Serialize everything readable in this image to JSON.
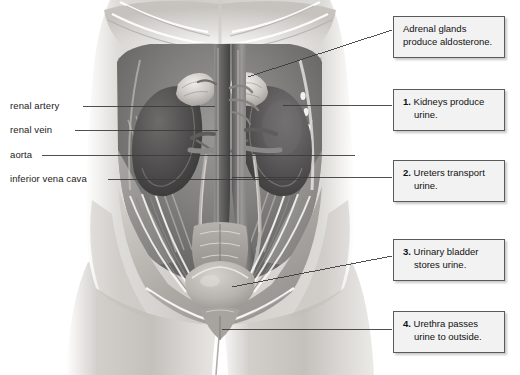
{
  "figure": {
    "palette": {
      "skin_light": "#e9e7e4",
      "skin_mid": "#c9c6c2",
      "skin_shadow": "#9a9894",
      "muscle": "#b6b3af",
      "cavity_dark": "#6b6a68",
      "kidney": "#4e4d4c",
      "kidney_light": "#757372",
      "vessel": "#8a8887",
      "bladder": "#bdbab6",
      "outline": "#4a4a4a",
      "leader_line": "#3c3c3c"
    }
  },
  "side_labels": [
    {
      "id": "renal-artery",
      "text": "renal artery"
    },
    {
      "id": "renal-vein",
      "text": "renal vein"
    },
    {
      "id": "aorta",
      "text": "aorta"
    },
    {
      "id": "inferior-vena-cava",
      "text": "inferior vena cava"
    }
  ],
  "callouts": [
    {
      "id": "adrenal-glands",
      "number": "",
      "line1": "Adrenal glands",
      "line2": "produce aldosterone."
    },
    {
      "id": "kidneys",
      "number": "1.",
      "line1": "Kidneys produce",
      "line2": "urine."
    },
    {
      "id": "ureters",
      "number": "2.",
      "line1": "Ureters transport",
      "line2": "urine."
    },
    {
      "id": "urinary-bladder",
      "number": "3.",
      "line1": "Urinary bladder",
      "line2": "stores urine."
    },
    {
      "id": "urethra",
      "number": "4.",
      "line1": "Urethra passes",
      "line2": "urine to outside."
    }
  ]
}
